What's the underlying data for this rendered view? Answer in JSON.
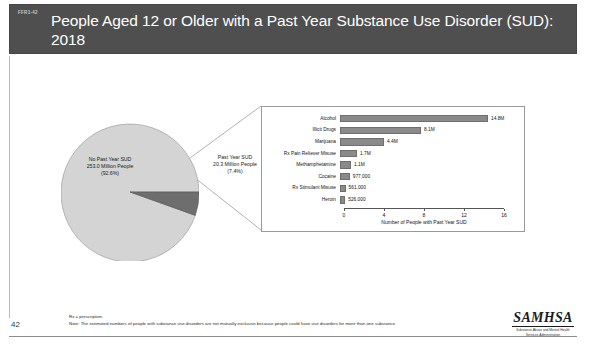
{
  "slide": {
    "code": "FFR1-42",
    "title": "People Aged 12 or Older with a Past Year Substance Use Disorder (SUD): 2018",
    "page_number": "42"
  },
  "colors": {
    "title_bar": "#4f4f4f",
    "title_text": "#ffffff",
    "pie_major": "#d4d4d4",
    "pie_minor": "#6e6e6e",
    "bar_fill": "#8a8a8a",
    "axis": "#555555"
  },
  "chart_data": [
    {
      "type": "pie",
      "title": "People Aged 12 or Older with a Past Year Substance Use Disorder (SUD): 2018",
      "slices": [
        {
          "name": "No Past Year SUD",
          "value": 253.0,
          "percent": 92.6,
          "label_lines": [
            "No Past Year SUD",
            "253.0 Million People",
            "(92.6%)"
          ],
          "color": "#d4d4d4"
        },
        {
          "name": "Past Year SUD",
          "value": 20.3,
          "percent": 7.4,
          "label_lines": [
            "Past Year SUD",
            "20.3 Million People",
            "(7.4%)"
          ],
          "color": "#6e6e6e"
        }
      ],
      "units": "Million People",
      "legend": "none"
    },
    {
      "type": "bar",
      "orientation": "horizontal",
      "title": "",
      "xlabel": "Number of People with Past Year SUD",
      "ylabel": "",
      "xlim": [
        0,
        16
      ],
      "xticks": [
        0,
        4,
        8,
        12,
        16
      ],
      "xtick_labels": [
        "0",
        "4",
        "8",
        "12",
        "16"
      ],
      "grid": false,
      "units": "millions",
      "categories": [
        "Alcohol",
        "Illicit Drugs",
        "Marijuana",
        "Rx Pain Reliever Misuse",
        "Methamphetamine",
        "Cocaine",
        "Rx Stimulant Misuse",
        "Heroin"
      ],
      "values": [
        14.8,
        8.1,
        4.4,
        1.7,
        1.1,
        0.977,
        0.561,
        0.526
      ],
      "data_labels": [
        "14.8M",
        "8.1M",
        "4.4M",
        "1.7M",
        "1.1M",
        "977,000",
        "561,000",
        "526,000"
      ]
    }
  ],
  "footnotes": [
    "Rx = prescription.",
    "Note: The estimated numbers of people with substance use disorders are not mutually exclusive because people could have use disorders for more than one substance."
  ],
  "logo": {
    "word": "SAMHSA",
    "subtitle_line1": "Substance Abuse and Mental Health",
    "subtitle_line2": "Services Administration"
  }
}
